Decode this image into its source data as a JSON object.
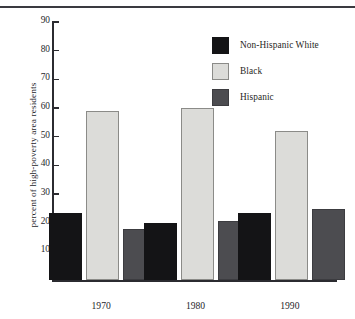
{
  "chart_data": {
    "type": "bar",
    "title": "",
    "xlabel": "",
    "ylabel": "percent of high-poverty area residents",
    "categories": [
      "1970",
      "1980",
      "1990"
    ],
    "series": [
      {
        "name": "Non-Hispanic White",
        "color": "#141416",
        "values": [
          23.5,
          20.2,
          23.5
        ]
      },
      {
        "name": "Black",
        "color": "#dcdcd9",
        "values": [
          59.0,
          60.0,
          52.2
        ]
      },
      {
        "name": "Hispanic",
        "color": "#4c4c50",
        "values": [
          17.8,
          20.7,
          25.0
        ]
      }
    ],
    "ylim": [
      0,
      90
    ],
    "yticks": [
      10,
      20,
      30,
      40,
      50,
      60,
      70,
      80,
      90
    ],
    "ytick_labels": [
      "10",
      "20",
      "30",
      "40",
      "50",
      "60",
      "70",
      "80",
      "90"
    ],
    "grid": false,
    "legend_position": "top-right"
  },
  "legend": {
    "entries": [
      {
        "label": "Non-Hispanic White",
        "swatch": "#141416"
      },
      {
        "label": "Black",
        "swatch": "#dcdcd9"
      },
      {
        "label": "Hispanic",
        "swatch": "#4c4c50"
      }
    ]
  }
}
